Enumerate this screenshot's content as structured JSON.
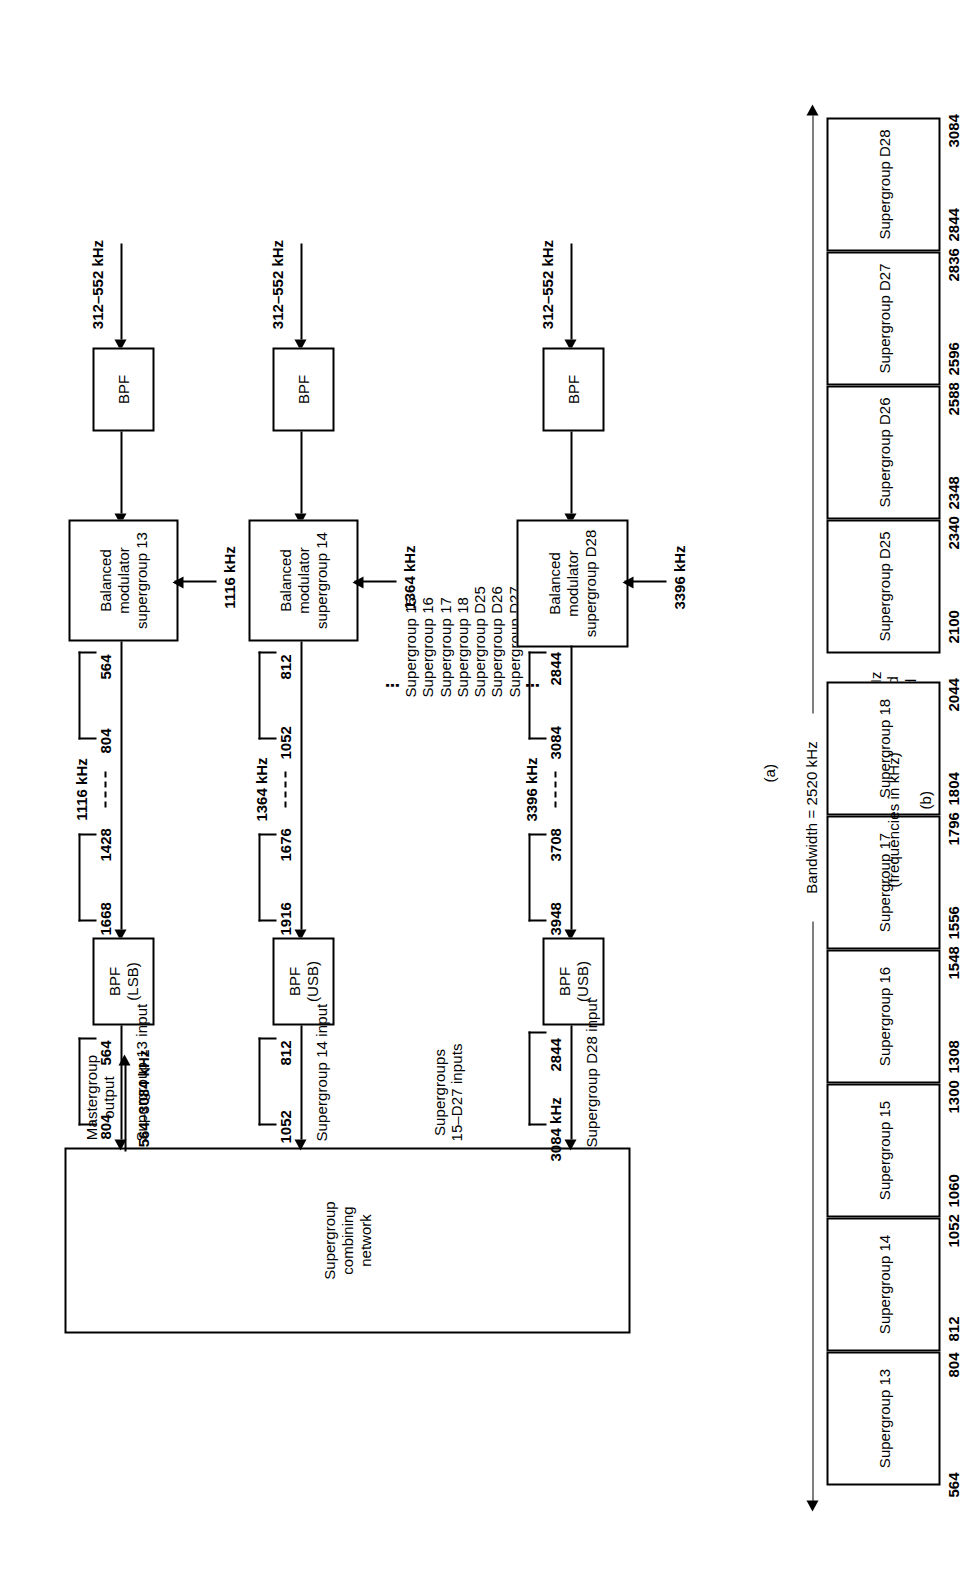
{
  "figure": {
    "part_a_label": "(a)",
    "part_b_label": "(b)",
    "part_b_units": "(frequencies in kHz)"
  },
  "part_a": {
    "combining_network": {
      "label": "Supergroup\ncombining\nnetwork"
    },
    "mastergroup_output": {
      "label": "Mastergroup\noutput",
      "range": "564–3084 kHz"
    },
    "branches": [
      {
        "id": "sg13",
        "input_range": "312–552 kHz",
        "bpf_in_label": "BPF",
        "modulator_label": "Balanced\nmodulator\nsupergroup 13",
        "carrier": "1116 kHz",
        "lsb_low": "564",
        "lsb_high": "804",
        "usb_low": "1428",
        "usb_high": "1668",
        "bpf_out_label": "BPF\n(LSB)",
        "out_low": "564",
        "out_high": "804",
        "output_label": "Supergroup 13 input"
      },
      {
        "id": "sg14",
        "input_range": "312–552 kHz",
        "bpf_in_label": "BPF",
        "modulator_label": "Balanced\nmodulator\nsupergroup 14",
        "carrier": "1364 kHz",
        "lsb_low": "812",
        "lsb_high": "1052",
        "usb_low": "1676",
        "usb_high": "1916",
        "bpf_out_label": "BPF\n(USB)",
        "out_low": "812",
        "out_high": "1052",
        "output_label": "Supergroup 14 input"
      },
      {
        "id": "sgD28",
        "input_range": "312–552 kHz",
        "bpf_in_label": "BPF",
        "modulator_label": "Balanced\nmodulator\nsupergroup D28",
        "carrier": "3396 kHz",
        "lsb_low": "2844",
        "lsb_high": "3084",
        "usb_low": "3708",
        "usb_high": "3948",
        "bpf_out_label": "BPF\n(USB)",
        "out_low": "2844",
        "out_high": "3084 kHz",
        "output_label": "Supergroup D28 input"
      }
    ],
    "middle_inputs_label": "Supergroups\n15–D27 inputs",
    "middle_list": {
      "ellipsis_top": "⋮",
      "items": [
        "Supergroup 15",
        "Supergroup 16",
        "Supergroup 17",
        "Supergroup 18",
        "Supergroup D25",
        "Supergroup D26",
        "Supergroup D27"
      ],
      "ellipsis_bottom": "⋮"
    }
  },
  "part_b": {
    "bandwidth_label": "Bandwidth = 2520 kHz",
    "guard_8": "8-kHz\nguard\nband",
    "guard_56": "56-kHz\nguard\nband",
    "blocks": [
      {
        "label": "Supergroup 13",
        "low": "564",
        "high": "804"
      },
      {
        "label": "Supergroup 14",
        "low": "812",
        "high": "1052"
      },
      {
        "label": "Supergroup 15",
        "low": "1060",
        "high": "1300"
      },
      {
        "label": "Supergroup 16",
        "low": "1308",
        "high": "1548"
      },
      {
        "label": "Supergroup 17",
        "low": "1556",
        "high": "1796"
      },
      {
        "label": "Supergroup 18",
        "low": "1804",
        "high": "2044"
      },
      {
        "label": "Supergroup D25",
        "low": "2100",
        "high": "2340"
      },
      {
        "label": "Supergroup D26",
        "low": "2348",
        "high": "2588"
      },
      {
        "label": "Supergroup D27",
        "low": "2596",
        "high": "2836"
      },
      {
        "label": "Supergroup D28",
        "low": "2844",
        "high": "3084"
      }
    ]
  }
}
